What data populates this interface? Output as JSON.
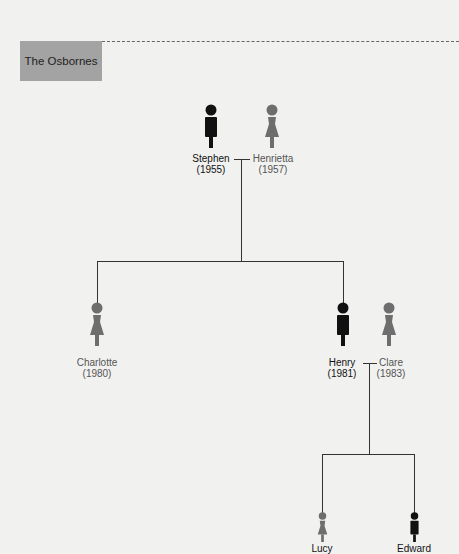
{
  "title": "The Osbornes",
  "colors": {
    "male": "#111111",
    "female": "#6e6e6e",
    "title_box": "#a3a3a3",
    "line": "#333333"
  },
  "people": {
    "stephen": {
      "name": "Stephen",
      "year": "(1955)",
      "gender": "male"
    },
    "henrietta": {
      "name": "Henrietta",
      "year": "(1957)",
      "gender": "female"
    },
    "charlotte": {
      "name": "Charlotte",
      "year": "(1980)",
      "gender": "female"
    },
    "henry": {
      "name": "Henry",
      "year": "(1981)",
      "gender": "male"
    },
    "clare": {
      "name": "Clare",
      "year": "(1983)",
      "gender": "female"
    },
    "lucy": {
      "name": "Lucy",
      "gender": "female"
    },
    "edward": {
      "name": "Edward",
      "gender": "male"
    }
  }
}
